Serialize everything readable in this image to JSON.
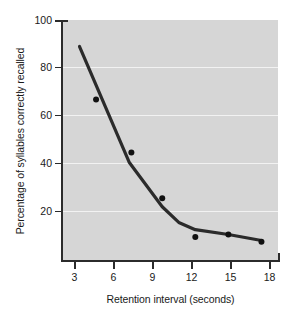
{
  "chart_data": {
    "type": "line",
    "title": "",
    "subtitle": "",
    "xlabel": "Retention interval (seconds)",
    "ylabel": "Percentage of syllables correctly recalled",
    "xlim": [
      0,
      19.5
    ],
    "ylim": [
      0,
      100
    ],
    "xticks": [
      3,
      6,
      9,
      12,
      15,
      18
    ],
    "xtick_labels": [
      "3",
      "6",
      "9",
      "12",
      "15",
      "18"
    ],
    "yticks": [
      20,
      40,
      60,
      80,
      100
    ],
    "ytick_labels": [
      "20",
      "40",
      "60",
      "80",
      "100"
    ],
    "grid": "horizontal",
    "gridlines_at": [
      20,
      40,
      60,
      80
    ],
    "legend": null,
    "legend_position": "none",
    "plot_background": "#d6d6d6",
    "gridline_color": "#f2f2f2",
    "line_color": "#2b2b2b",
    "marker_color": "#111111",
    "axis_color": "#2b2b2b",
    "series": [
      {
        "name": "scatter-points",
        "type": "scatter",
        "x": [
          3,
          6.2,
          9,
          12,
          15,
          18
        ],
        "values": [
          67,
          45,
          26,
          10,
          11,
          8
        ]
      },
      {
        "name": "fitted-curve",
        "type": "line",
        "x": [
          1.5,
          6,
          9,
          10.5,
          12,
          15,
          18
        ],
        "values": [
          89,
          41,
          22.5,
          16,
          13,
          11,
          8.5
        ]
      }
    ]
  }
}
